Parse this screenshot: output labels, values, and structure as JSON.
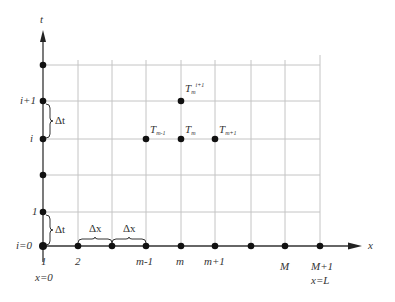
{
  "diagram": {
    "type": "finite-difference-grid",
    "axes": {
      "x_label": "x",
      "t_label": "t"
    },
    "t_labels": [
      {
        "text": "i+1",
        "y": 101
      },
      {
        "text": "i",
        "y": 139
      },
      {
        "text": "1",
        "y": 212
      },
      {
        "text": "i=0",
        "y": 246
      }
    ],
    "x_labels": [
      {
        "text": "1",
        "x": 43
      },
      {
        "text": "2",
        "x": 78
      },
      {
        "text": "m-1",
        "x": 146
      },
      {
        "text": "m",
        "x": 181
      },
      {
        "text": "m+1",
        "x": 215
      },
      {
        "text": "M",
        "x": 285
      },
      {
        "text": "M+1",
        "x": 320
      }
    ],
    "boundary_labels": {
      "left": "x=0",
      "right": "x=L"
    },
    "step_labels": {
      "dt": "Δt",
      "dx": "Δx"
    },
    "node_labels": {
      "t_m_next": {
        "base": "T",
        "sub": "m",
        "sup": "i+1"
      },
      "t_m_minus": {
        "base": "T",
        "sub": "m-1"
      },
      "t_m": {
        "base": "T",
        "sub": "m"
      },
      "t_m_plus": {
        "base": "T",
        "sub": "m+1"
      }
    },
    "colors": {
      "axis": "#333333",
      "grid": "#bdbdbd",
      "node": "#111111"
    }
  }
}
